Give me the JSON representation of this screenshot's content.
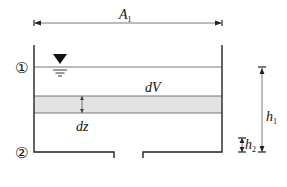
{
  "diagram": {
    "title": "",
    "width_label": {
      "main": "A",
      "sub": "1"
    },
    "volume_label": "dV",
    "thickness_label": "dz",
    "height_labels": {
      "h1": {
        "main": "h",
        "sub": "1"
      },
      "h2": {
        "main": "h",
        "sub": "2"
      }
    },
    "section_markers": {
      "top": "①",
      "bottom": "②"
    },
    "colors": {
      "line": "#222222",
      "band_fill": "#e3e3e3",
      "dimension_line": "#444444",
      "background": "#ffffff"
    }
  }
}
